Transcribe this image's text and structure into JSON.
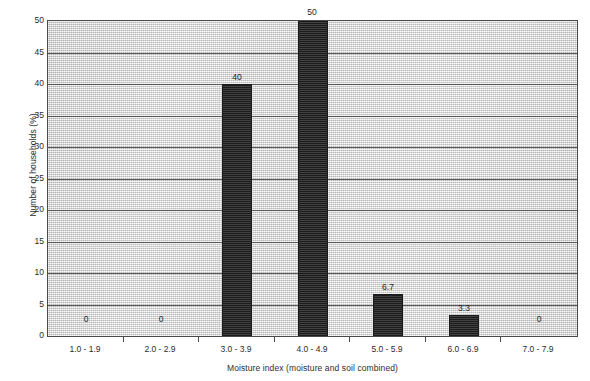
{
  "chart_data": {
    "type": "bar",
    "title": "",
    "xlabel": "Moisture index (moisture and soil combined)",
    "ylabel": "Number of households (%)",
    "categories": [
      "1.0 - 1.9",
      "2.0 - 2.9",
      "3.0 - 3.9",
      "4.0 - 4.9",
      "5.0 - 5.9",
      "6.0 - 6.9",
      "7.0 - 7.9"
    ],
    "values": [
      0,
      0,
      40,
      50,
      6.7,
      3.3,
      0
    ],
    "data_labels": [
      "0",
      "0",
      "40",
      "50",
      "6.7",
      "3.3",
      "0"
    ],
    "ylim": [
      0,
      50
    ],
    "ytick_labels": [
      "0",
      "5",
      "10",
      "15",
      "20",
      "25",
      "30",
      "35",
      "40",
      "45",
      "50"
    ],
    "ytick_values": [
      0,
      5,
      10,
      15,
      20,
      25,
      30,
      35,
      40,
      45,
      50
    ],
    "grid": "horizontal",
    "legend": "none",
    "bar_color": "#2b2b2b",
    "plot_background": "#dedede",
    "axis_color": "#4a4a4a",
    "gridline_color": "#5a5a5a"
  }
}
